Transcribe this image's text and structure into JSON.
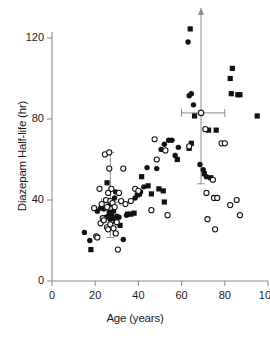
{
  "chart_data": {
    "type": "scatter",
    "title": "",
    "xlabel": "Age (years)",
    "ylabel": "Diazepam Half-life (hr)",
    "xlim": [
      0,
      100
    ],
    "ylim": [
      0,
      128
    ],
    "xticks": [
      0,
      20,
      40,
      60,
      80,
      100
    ],
    "yticks": [
      0,
      40,
      80,
      120
    ],
    "xtick_labels": [
      "0",
      "20",
      "40",
      "60",
      "80",
      "100"
    ],
    "ytick_labels": [
      "0",
      "40",
      "80",
      "120"
    ],
    "grid": false,
    "legend": "none",
    "axis_color": "#8c8c8c",
    "marker_color": "#111111",
    "errorbar_color": "#8c8c8c",
    "series": [
      {
        "name": "filled-square",
        "marker": "square",
        "fill": "solid",
        "color": "#111111",
        "points": [
          [
            18.0,
            15.5
          ],
          [
            25.5,
            48.5
          ],
          [
            27.0,
            38.0
          ],
          [
            29.5,
            29.5
          ],
          [
            31.5,
            27.5
          ],
          [
            35.0,
            33.0
          ],
          [
            36.5,
            33.0
          ],
          [
            38.0,
            33.5
          ],
          [
            39.5,
            42.5
          ],
          [
            40.5,
            43.0
          ],
          [
            41.5,
            51.5
          ],
          [
            44.5,
            47.0
          ],
          [
            46.0,
            43.0
          ],
          [
            49.5,
            45.5
          ],
          [
            51.5,
            44.5
          ],
          [
            52.0,
            39.0
          ],
          [
            58.0,
            60.0
          ],
          [
            63.5,
            65.5
          ],
          [
            64.0,
            124.5
          ],
          [
            64.5,
            68.0
          ],
          [
            66.0,
            81.5
          ],
          [
            70.5,
            53.0
          ],
          [
            72.5,
            74.5
          ],
          [
            73.5,
            51.0
          ],
          [
            76.0,
            74.5
          ],
          [
            82.5,
            100.0
          ],
          [
            83.5,
            105.0
          ],
          [
            83.0,
            92.5
          ],
          [
            86.0,
            92.0
          ],
          [
            87.0,
            92.0
          ],
          [
            95.0,
            81.5
          ]
        ]
      },
      {
        "name": "filled-circle",
        "marker": "circle",
        "fill": "solid",
        "color": "#111111",
        "points": [
          [
            15.0,
            24.0
          ],
          [
            17.5,
            20.0
          ],
          [
            21.0,
            34.5
          ],
          [
            22.5,
            36.0
          ],
          [
            24.0,
            35.5
          ],
          [
            25.0,
            31.5
          ],
          [
            26.0,
            32.0
          ],
          [
            26.5,
            34.0
          ],
          [
            27.0,
            30.5
          ],
          [
            27.5,
            32.5
          ],
          [
            28.0,
            31.0
          ],
          [
            28.5,
            34.5
          ],
          [
            29.0,
            41.0
          ],
          [
            29.5,
            44.0
          ],
          [
            30.0,
            32.0
          ],
          [
            31.0,
            31.5
          ],
          [
            33.0,
            20.5
          ],
          [
            34.5,
            32.5
          ],
          [
            38.5,
            41.0
          ],
          [
            41.0,
            44.0
          ],
          [
            42.5,
            46.5
          ],
          [
            44.0,
            56.0
          ],
          [
            48.5,
            55.5
          ],
          [
            50.5,
            65.0
          ],
          [
            52.0,
            67.5
          ],
          [
            54.0,
            69.5
          ],
          [
            55.5,
            69.5
          ],
          [
            57.0,
            62.0
          ],
          [
            58.5,
            66.0
          ],
          [
            63.5,
            91.5
          ],
          [
            64.5,
            92.5
          ],
          [
            65.5,
            87.0
          ],
          [
            68.5,
            57.5
          ],
          [
            70.0,
            55.0
          ],
          [
            71.5,
            51.5
          ],
          [
            63.0,
            118.0
          ]
        ]
      },
      {
        "name": "open-circle",
        "marker": "circle",
        "fill": "open",
        "color": "#111111",
        "points": [
          [
            19.5,
            36.0
          ],
          [
            20.5,
            22.0
          ],
          [
            21.0,
            21.5
          ],
          [
            22.0,
            45.5
          ],
          [
            22.5,
            28.5
          ],
          [
            23.0,
            38.0
          ],
          [
            23.5,
            31.0
          ],
          [
            24.0,
            30.0
          ],
          [
            24.5,
            62.5
          ],
          [
            25.0,
            40.0
          ],
          [
            25.5,
            36.5
          ],
          [
            25.5,
            26.5
          ],
          [
            26.0,
            43.5
          ],
          [
            26.0,
            25.5
          ],
          [
            26.5,
            63.5
          ],
          [
            26.5,
            55.5
          ],
          [
            27.0,
            39.5
          ],
          [
            27.0,
            28.0
          ],
          [
            27.5,
            45.5
          ],
          [
            28.0,
            38.5
          ],
          [
            28.5,
            26.0
          ],
          [
            29.0,
            36.5
          ],
          [
            29.5,
            23.5
          ],
          [
            30.0,
            29.0
          ],
          [
            30.5,
            15.5
          ],
          [
            31.0,
            43.5
          ],
          [
            32.0,
            39.5
          ],
          [
            33.0,
            55.5
          ],
          [
            34.0,
            38.0
          ],
          [
            36.5,
            39.5
          ],
          [
            38.5,
            45.5
          ],
          [
            40.0,
            44.5
          ],
          [
            46.0,
            35.0
          ],
          [
            47.5,
            70.0
          ],
          [
            48.5,
            60.0
          ],
          [
            52.5,
            64.5
          ],
          [
            53.5,
            32.5
          ],
          [
            63.5,
            66.5
          ],
          [
            69.0,
            83.0
          ],
          [
            71.0,
            75.0
          ],
          [
            71.5,
            43.5
          ],
          [
            72.0,
            30.5
          ],
          [
            74.5,
            50.0
          ],
          [
            75.0,
            41.0
          ],
          [
            76.5,
            41.0
          ],
          [
            75.5,
            25.5
          ],
          [
            78.5,
            68.0
          ],
          [
            80.0,
            68.0
          ],
          [
            82.5,
            37.5
          ],
          [
            85.5,
            40.0
          ],
          [
            87.0,
            32.5
          ]
        ]
      }
    ],
    "errorbars": [
      {
        "name": "young-group",
        "x": 27.0,
        "y": 39.0,
        "y_low": 21.5,
        "y_high": 63.5,
        "x_low": 23.0,
        "x_high": 31.5,
        "mean_marker": "open-square",
        "arrow_up": false
      },
      {
        "name": "elderly-group",
        "x": 69.0,
        "y": 83.0,
        "y_low": 48.0,
        "y_high": 128.0,
        "x_low": 60.0,
        "x_high": 80.0,
        "mean_marker": "open-circle",
        "arrow_up": true
      }
    ]
  }
}
